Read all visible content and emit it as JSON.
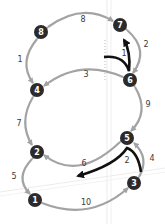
{
  "colors": {
    "background": "#ffffff",
    "edge": "#a3a3a3",
    "node_fill": "#2b2b2b",
    "node_text": "#ffffff",
    "label": "#3a3a3a",
    "highlight_arrow": "#111111",
    "faint_lines": "#e6e6e6"
  },
  "nodes": [
    {
      "id": "1",
      "label": "1",
      "x": 35,
      "y": 200
    },
    {
      "id": "2",
      "label": "2",
      "x": 37,
      "y": 152
    },
    {
      "id": "3",
      "label": "3",
      "x": 134,
      "y": 183
    },
    {
      "id": "4",
      "label": "4",
      "x": 37,
      "y": 90
    },
    {
      "id": "5",
      "label": "5",
      "x": 127,
      "y": 138
    },
    {
      "id": "6",
      "label": "6",
      "x": 130,
      "y": 80
    },
    {
      "id": "7",
      "label": "7",
      "x": 120,
      "y": 25
    },
    {
      "id": "8",
      "label": "8",
      "x": 41,
      "y": 32
    }
  ],
  "edges": [
    {
      "from": "8",
      "to": "7",
      "label": "8",
      "lx": 83,
      "ly": 22
    },
    {
      "from": "7",
      "to": "6",
      "label": "2",
      "lx": 146,
      "ly": 47
    },
    {
      "from": "8",
      "to": "4",
      "label": "1",
      "lx": 20,
      "ly": 62
    },
    {
      "from": "6",
      "to": "4",
      "label": "3",
      "lx": 86,
      "ly": 77
    },
    {
      "from": "6",
      "to": "5",
      "label": "9",
      "lx": 148,
      "ly": 107
    },
    {
      "from": "4",
      "to": "2",
      "label": "7",
      "lx": 19,
      "ly": 126
    },
    {
      "from": "5",
      "to": "2",
      "label": "6",
      "lx": 84,
      "ly": 166
    },
    {
      "from": "3",
      "to": "5",
      "label": "4",
      "lx": 152,
      "ly": 161
    },
    {
      "from": "2",
      "to": "1",
      "label": "5",
      "lx": 14,
      "ly": 179
    },
    {
      "from": "1",
      "to": "3",
      "label": "10",
      "lx": 86,
      "ly": 205
    }
  ],
  "highlights": [
    {
      "name": "highlight-arrow-upper",
      "label": "1",
      "lx": 124,
      "ly": 56
    },
    {
      "name": "highlight-arrow-lower",
      "label": "2",
      "lx": 127,
      "ly": 163
    }
  ]
}
